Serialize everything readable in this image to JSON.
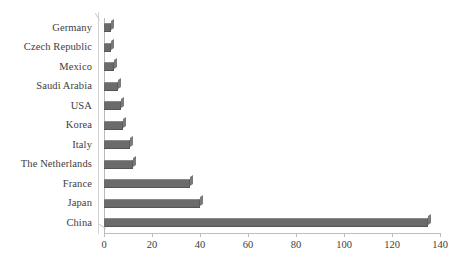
{
  "chart_data": {
    "type": "bar",
    "orientation": "horizontal",
    "title": "",
    "xlabel": "",
    "ylabel": "",
    "xlim": [
      0,
      140
    ],
    "xticks": [
      0,
      20,
      40,
      60,
      80,
      100,
      120,
      140
    ],
    "grid": false,
    "legend": false,
    "bar_color": "#6b6b6b",
    "background_color": "#ffffff",
    "axis_color": "#bdbdbd",
    "categories": [
      "Germany",
      "Czech Republic",
      "Mexico",
      "Saudi Arabia",
      "USA",
      "Korea",
      "Italy",
      "The Netherlands",
      "France",
      "Japan",
      "China"
    ],
    "values": [
      3,
      3,
      4,
      6,
      7,
      8,
      11,
      12,
      36,
      40,
      135
    ]
  }
}
